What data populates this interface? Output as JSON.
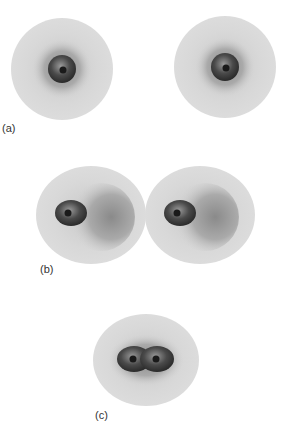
{
  "figure": {
    "panels": [
      {
        "label": "(a)",
        "description": "Two separated hydrogen atoms with spherical electron clouds"
      },
      {
        "label": "(b)",
        "description": "Two atoms approaching; electron clouds distort toward each other"
      },
      {
        "label": "(c)",
        "description": "Bonded molecule with shared electron cloud around two nuclei"
      }
    ],
    "colors": {
      "outer_cloud": "#d9d9d9",
      "inner_cloud": "#a8a8a8",
      "core_dark": "#3a3a3a",
      "nucleus": "#1a1a1a"
    }
  }
}
